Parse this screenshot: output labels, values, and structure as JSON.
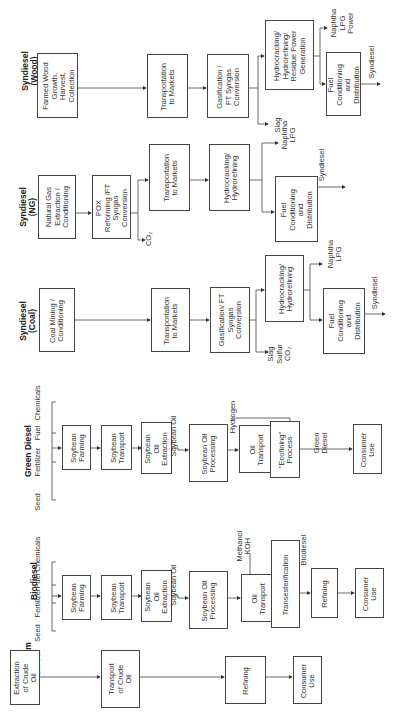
{
  "columns": [
    {
      "title": "Petroleum\nDiesel",
      "boxes": [
        "Extraction\nof Crude\nOil",
        "Transport\nof Crude\nOil",
        "Refining",
        "Consumer\nUse"
      ]
    },
    {
      "title": "Biodiesel",
      "inputs": [
        "Seed",
        "Fertilizer",
        "Fuel",
        "Chemicals"
      ],
      "boxes": [
        "Soybean\nFarming",
        "Soybean\nTransport",
        "Soybean\nOil\nExtraction",
        "Soybean Oil\nProcessing",
        "Oil\nTransport",
        "Transesterification",
        "Refining",
        "Consumer\nUse"
      ],
      "flow_labels": {
        "soybean_oil": "Soybean Oil",
        "methanol_koh": "Methanol\nKOH",
        "biodiesel": "Biodiesel"
      }
    },
    {
      "title": "Green Diesel",
      "inputs": [
        "Seed",
        "Fertilizer",
        "Fuel",
        "Chemicals"
      ],
      "boxes": [
        "Soybean\nFarming",
        "Soybean\nTransport",
        "Soybean\nOil\nExtraction",
        "Soybean Oil\nProcessing",
        "Oil\nTransport",
        "\"Ecofining\"\nProcess",
        "Consumer\nUse"
      ],
      "flow_labels": {
        "soybean_oil": "Soybean Oil",
        "hydrogen": "Hydrogen",
        "green_diesel": "Green\nDiesel"
      }
    },
    {
      "title": "Syndiesel\n(Coal)",
      "boxes": [
        "Coal Mining /\nConditioning",
        "Transportation\nto Markets",
        "Gasification/ FT\nSyngas\nConversion",
        "Hydrocracking/\nHydrorefining",
        "Fuel\nConditioning\nand\nDistribution"
      ],
      "flow_labels": {
        "byproducts": "Slag\nSulfur\nCO₂",
        "coproducts": "Naphtha\nLPG",
        "product": "Syndiesel"
      }
    },
    {
      "title": "Syndiesel\n(NG)",
      "boxes": [
        "Natural Gas\nExtraction /\nConditioning",
        "POX\nReforming /FT\nSyngas\nConversion",
        "Transportation\nto Markets",
        "Hydrocracking/\nHydrorefining",
        "Fuel\nConditioning\nand\nDistribution"
      ],
      "flow_labels": {
        "byproducts": "CO₂",
        "coproducts": "Naphtha\nLPG",
        "product": "Syndiesel"
      }
    },
    {
      "title": "Syndiesel\n(Wood)",
      "boxes": [
        "Farmed Wood\nGrowth,\nHarvest,\nCollection",
        "Transportation\nto Markets",
        "Gasification /\nFT Syngas\nConversion",
        "Hydrocracking/\nHydrorefining/\nResidue Power\nGeneration",
        "Fuel\nConditioning\nand\nDistribution"
      ],
      "flow_labels": {
        "byproducts": "Slag",
        "coproducts": "Naphtha\nLPG\nPower",
        "product": "Syndiesel"
      }
    }
  ]
}
